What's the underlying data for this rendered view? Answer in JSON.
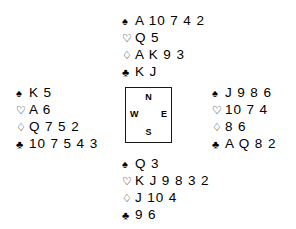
{
  "diagram": {
    "background_color": "#ffffff",
    "text_color": "#000000",
    "border_color": "#1a1a1a"
  },
  "suits": {
    "spade": {
      "symbol": "♠",
      "name": "spade-suit-symbol"
    },
    "heart": {
      "symbol": "♡",
      "name": "heart-suit-symbol"
    },
    "diamond": {
      "symbol": "♢",
      "name": "diamond-suit-symbol"
    },
    "club": {
      "symbol": "♣",
      "name": "club-suit-symbol"
    }
  },
  "compass": {
    "north": "N",
    "south": "S",
    "east": "E",
    "west": "W"
  },
  "hands": {
    "north": {
      "position": "North",
      "spades": "A 10 7 4 2",
      "hearts": "Q 5",
      "diamonds": "A K 9 3",
      "clubs": "K J"
    },
    "west": {
      "position": "West",
      "spades": "K 5",
      "hearts": "A 6",
      "diamonds": "Q 7 5 2",
      "clubs": "10 7 5 4 3"
    },
    "east": {
      "position": "East",
      "spades": "J 9 8 6",
      "hearts": "10 7 4",
      "diamonds": "8 6",
      "clubs": "A Q 8 2"
    },
    "south": {
      "position": "South",
      "spades": "Q 3",
      "hearts": "K J 9 8 3 2",
      "diamonds": "J 10 4",
      "clubs": "9 6"
    }
  }
}
